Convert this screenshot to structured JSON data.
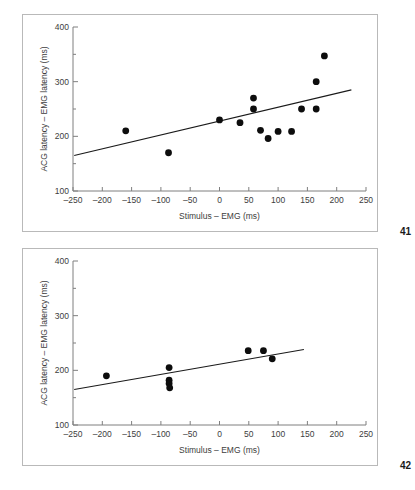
{
  "figure": {
    "panels": [
      {
        "number_label": "41",
        "name": "scatter-panel-top"
      },
      {
        "number_label": "42",
        "name": "scatter-panel-bottom"
      }
    ]
  },
  "chart_data": [
    {
      "type": "scatter",
      "title": "",
      "xlabel": "Stimulus – EMG (ms)",
      "ylabel": "ACG latency – EMG latency (ms)",
      "xlim": [
        -250,
        250
      ],
      "ylim": [
        100,
        400
      ],
      "xticks": [
        -250,
        -200,
        -150,
        -100,
        -50,
        0,
        50,
        100,
        150,
        200,
        250
      ],
      "xticklabels": [
        "–250",
        "–200",
        "–150",
        "–100",
        "–50",
        "0",
        "50",
        "100",
        "150",
        "200",
        "250"
      ],
      "yticks": [
        100,
        200,
        300,
        400
      ],
      "yticklabels": [
        "100",
        "200",
        "300",
        "400"
      ],
      "yminorticks": [
        150,
        250,
        350
      ],
      "grid": false,
      "legend": "none",
      "points": [
        {
          "x": -160,
          "y": 210
        },
        {
          "x": -87,
          "y": 170
        },
        {
          "x": 0,
          "y": 230
        },
        {
          "x": 35,
          "y": 225
        },
        {
          "x": 58,
          "y": 270
        },
        {
          "x": 58,
          "y": 250
        },
        {
          "x": 70,
          "y": 211
        },
        {
          "x": 83,
          "y": 196
        },
        {
          "x": 100,
          "y": 209
        },
        {
          "x": 123,
          "y": 209
        },
        {
          "x": 140,
          "y": 250
        },
        {
          "x": 165,
          "y": 250
        },
        {
          "x": 165,
          "y": 300
        },
        {
          "x": 179,
          "y": 347
        }
      ],
      "fit_line": {
        "x0": -248,
        "y0": 165,
        "x1": 225,
        "y1": 285
      }
    },
    {
      "type": "scatter",
      "title": "",
      "xlabel": "Stimulus – EMG (ms)",
      "ylabel": "ACG latency – EMG latency (ms)",
      "xlim": [
        -250,
        250
      ],
      "ylim": [
        100,
        400
      ],
      "xticks": [
        -250,
        -200,
        -150,
        -100,
        -50,
        0,
        50,
        100,
        150,
        200,
        250
      ],
      "xticklabels": [
        "–250",
        "–200",
        "–150",
        "–100",
        "–50",
        "0",
        "50",
        "100",
        "150",
        "200",
        "250"
      ],
      "yticks": [
        100,
        200,
        300,
        400
      ],
      "yticklabels": [
        "100",
        "200",
        "300",
        "400"
      ],
      "yminorticks": [
        150,
        250,
        350
      ],
      "grid": false,
      "legend": "none",
      "points": [
        {
          "x": -193,
          "y": 190
        },
        {
          "x": -86,
          "y": 205
        },
        {
          "x": -86,
          "y": 182
        },
        {
          "x": -86,
          "y": 176
        },
        {
          "x": -85,
          "y": 168
        },
        {
          "x": 49,
          "y": 236
        },
        {
          "x": 75,
          "y": 236
        },
        {
          "x": 90,
          "y": 221
        }
      ],
      "fit_line": {
        "x0": -248,
        "y0": 165,
        "x1": 144,
        "y1": 238
      }
    }
  ]
}
